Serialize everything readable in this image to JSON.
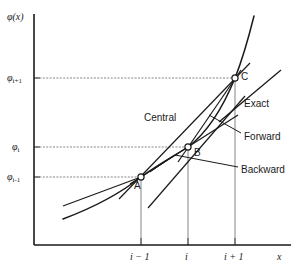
{
  "figure": {
    "type": "diagram",
    "background": "#ffffff",
    "ink": "#1a1a1a"
  },
  "axes": {
    "y_axis_label": "φ(x)",
    "y_axis_label_phi": "φ",
    "y_axis_label_paren": "(x)",
    "x_axis_label": "x",
    "origin_px": [
      34,
      245
    ],
    "x_axis_end_px": [
      290,
      245
    ],
    "y_axis_top_px": [
      34,
      14
    ],
    "y_ticks": [
      {
        "label_phi": "φ",
        "label_sub": "i+1",
        "y_px": 78
      },
      {
        "label_phi": "φ",
        "label_sub": "i",
        "y_px": 147
      },
      {
        "label_phi": "φ",
        "label_sub": "i-1",
        "y_px": 177
      }
    ],
    "x_ticks": [
      {
        "label": "i − 1",
        "x_px": 141
      },
      {
        "label": "i",
        "x_px": 188
      },
      {
        "label": "i + 1",
        "x_px": 235
      }
    ]
  },
  "points": [
    {
      "name": "A",
      "label": "A",
      "x_px": 141,
      "y_px": 177,
      "tick_x": "i − 1",
      "tick_y": "φi-1"
    },
    {
      "name": "B",
      "label": "B",
      "x_px": 188,
      "y_px": 147,
      "tick_x": "i",
      "tick_y": "φi"
    },
    {
      "name": "C",
      "label": "C",
      "x_px": 235,
      "y_px": 78,
      "tick_x": "i + 1",
      "tick_y": "φi+1"
    }
  ],
  "annotations": [
    {
      "name": "central",
      "label": "Central",
      "x_px": 144,
      "y_px": 113,
      "has_leader": false
    },
    {
      "name": "exact",
      "label": "Exact",
      "x_px": 244,
      "y_px": 99,
      "has_leader": true
    },
    {
      "name": "forward",
      "label": "Forward",
      "x_px": 244,
      "y_px": 132,
      "has_leader": true
    },
    {
      "name": "backward",
      "label": "Backward",
      "x_px": 241,
      "y_px": 165,
      "has_leader": true
    }
  ],
  "curves": {
    "exact_curve": "convex increasing function through A, B and C",
    "central_secant": "line through A and C",
    "forward_secant": "line through B and C",
    "backward_secant": "line through A and B",
    "tangent_at_B": "tangent line to exact curve at point B"
  }
}
